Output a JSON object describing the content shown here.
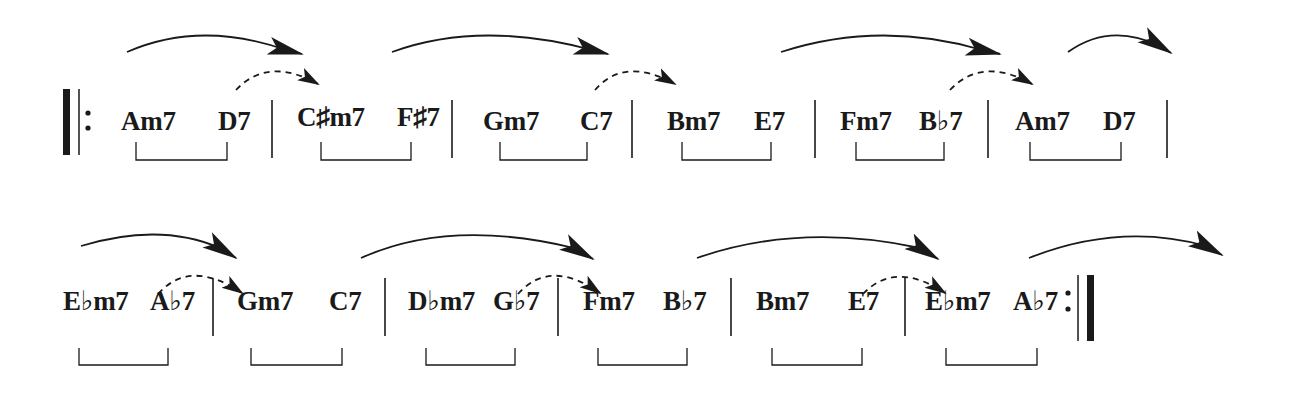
{
  "colors": {
    "ink": "#1a1a1a",
    "background": "#ffffff"
  },
  "rows": [
    {
      "name": "row-1",
      "start_barline": "repeat-start",
      "measures": [
        {
          "chords": [
            "Am7",
            "D7"
          ]
        },
        {
          "chords": [
            "C♯m7",
            "F♯7"
          ]
        },
        {
          "chords": [
            "Gm7",
            "C7"
          ]
        },
        {
          "chords": [
            "Bm7",
            "E7"
          ]
        },
        {
          "chords": [
            "Fm7",
            "B♭7"
          ]
        },
        {
          "chords": [
            "Am7",
            "D7"
          ]
        }
      ]
    },
    {
      "name": "row-2",
      "end_barline": "repeat-end",
      "measures": [
        {
          "chords": [
            "E♭m7",
            "A♭7"
          ]
        },
        {
          "chords": [
            "Gm7",
            "C7"
          ]
        },
        {
          "chords": [
            "D♭m7",
            "G♭7"
          ]
        },
        {
          "chords": [
            "Fm7",
            "B♭7"
          ]
        },
        {
          "chords": [
            "Bm7",
            "E7"
          ]
        },
        {
          "chords": [
            "E♭m7",
            "A♭7"
          ]
        }
      ]
    }
  ],
  "legend": {
    "bracket": "ii-V pair",
    "solid_arrow": "resolution to next measure",
    "dashed_arrow": "dominant resolves to next chord"
  }
}
